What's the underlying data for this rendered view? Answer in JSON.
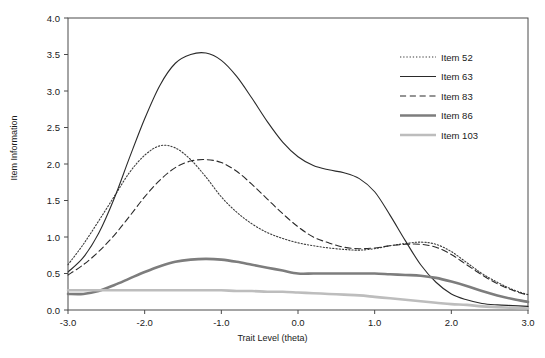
{
  "chart_data": {
    "type": "line",
    "title": "",
    "xlabel": "Trait Level (theta)",
    "ylabel": "Item Information",
    "xlim": [
      -3.0,
      3.0
    ],
    "ylim": [
      0.0,
      4.0
    ],
    "xticks": [
      "-3.0",
      "-2.0",
      "-1.0",
      "0.0",
      "1.0",
      "2.0",
      "3.0"
    ],
    "yticks": [
      "0.0",
      "0.5",
      "1.0",
      "1.5",
      "2.0",
      "2.5",
      "3.0",
      "3.5",
      "4.0"
    ],
    "grid": false,
    "legend_position": "upper right",
    "x": [
      -3.0,
      -2.8,
      -2.6,
      -2.4,
      -2.2,
      -2.0,
      -1.8,
      -1.6,
      -1.4,
      -1.2,
      -1.0,
      -0.8,
      -0.6,
      -0.4,
      -0.2,
      0.0,
      0.2,
      0.4,
      0.6,
      0.8,
      1.0,
      1.2,
      1.4,
      1.6,
      1.8,
      2.0,
      2.2,
      2.4,
      2.6,
      2.8,
      3.0
    ],
    "series": [
      {
        "name": "Item 52",
        "color": "#3a3a3a",
        "style": "dotted",
        "width": 1.1,
        "values": [
          0.62,
          0.9,
          1.22,
          1.55,
          1.88,
          2.12,
          2.25,
          2.22,
          2.06,
          1.82,
          1.55,
          1.34,
          1.18,
          1.06,
          0.98,
          0.92,
          0.88,
          0.85,
          0.83,
          0.82,
          0.84,
          0.88,
          0.91,
          0.93,
          0.9,
          0.8,
          0.65,
          0.5,
          0.38,
          0.28,
          0.21
        ]
      },
      {
        "name": "Item 63",
        "color": "#2a2a2a",
        "style": "solid",
        "width": 1.1,
        "values": [
          0.52,
          0.72,
          1.05,
          1.52,
          2.08,
          2.62,
          3.08,
          3.38,
          3.5,
          3.52,
          3.42,
          3.2,
          2.9,
          2.58,
          2.3,
          2.1,
          1.98,
          1.92,
          1.88,
          1.8,
          1.62,
          1.3,
          0.95,
          0.62,
          0.38,
          0.22,
          0.14,
          0.09,
          0.07,
          0.06,
          0.05
        ]
      },
      {
        "name": "Item 83",
        "color": "#2a2a2a",
        "style": "dashed",
        "width": 1.1,
        "values": [
          0.48,
          0.62,
          0.8,
          1.02,
          1.28,
          1.55,
          1.78,
          1.95,
          2.04,
          2.06,
          2.02,
          1.9,
          1.72,
          1.52,
          1.32,
          1.14,
          1.0,
          0.92,
          0.86,
          0.84,
          0.85,
          0.88,
          0.9,
          0.9,
          0.86,
          0.76,
          0.62,
          0.48,
          0.36,
          0.27,
          0.2
        ]
      },
      {
        "name": "Item 86",
        "color": "#7d7d7d",
        "style": "solid",
        "width": 2.6,
        "values": [
          0.22,
          0.22,
          0.26,
          0.34,
          0.43,
          0.52,
          0.6,
          0.66,
          0.69,
          0.7,
          0.69,
          0.66,
          0.62,
          0.58,
          0.54,
          0.5,
          0.5,
          0.5,
          0.5,
          0.5,
          0.5,
          0.49,
          0.48,
          0.47,
          0.44,
          0.39,
          0.33,
          0.26,
          0.2,
          0.15,
          0.11
        ]
      },
      {
        "name": "Item 103",
        "color": "#bdbdbd",
        "style": "solid",
        "width": 2.6,
        "values": [
          0.27,
          0.27,
          0.27,
          0.27,
          0.27,
          0.27,
          0.27,
          0.27,
          0.27,
          0.27,
          0.27,
          0.26,
          0.26,
          0.25,
          0.25,
          0.24,
          0.23,
          0.22,
          0.21,
          0.2,
          0.18,
          0.16,
          0.14,
          0.12,
          0.1,
          0.08,
          0.07,
          0.05,
          0.04,
          0.03,
          0.02
        ]
      }
    ]
  },
  "legend": {
    "entries": [
      {
        "label": "Item 52"
      },
      {
        "label": "Item 63"
      },
      {
        "label": "Item 83"
      },
      {
        "label": "Item 86"
      },
      {
        "label": "Item 103"
      }
    ]
  }
}
